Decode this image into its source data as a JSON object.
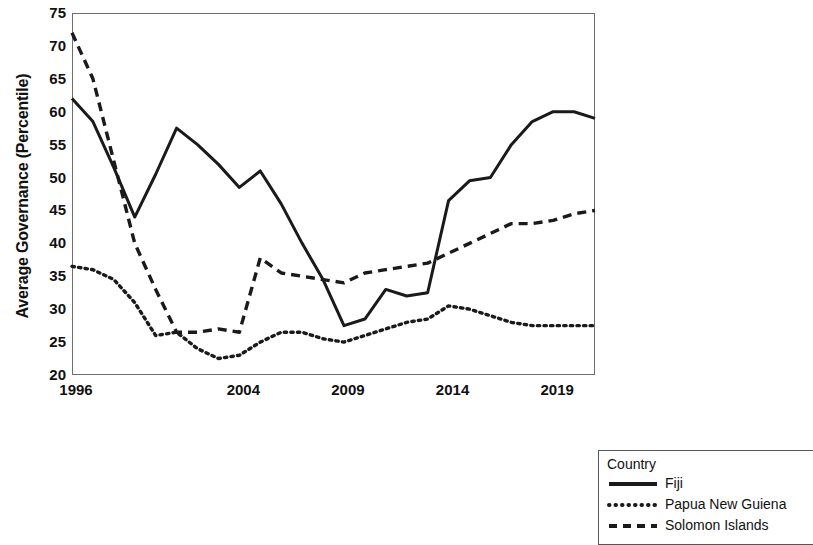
{
  "chart_data": {
    "type": "line",
    "title": "",
    "xlabel": "",
    "ylabel": "Average Governance (Percentile)",
    "xlim": [
      1996,
      2021
    ],
    "ylim": [
      20,
      75
    ],
    "ytick_labels": [
      "75",
      "70",
      "65",
      "60",
      "55",
      "50",
      "45",
      "40",
      "35",
      "30",
      "25",
      "20"
    ],
    "ytick_values": [
      75,
      70,
      65,
      60,
      55,
      50,
      45,
      40,
      35,
      30,
      25,
      20
    ],
    "xtick_labels": [
      "1996",
      "2004",
      "2009",
      "2014",
      "2019"
    ],
    "xtick_values": [
      1996,
      2004,
      2009,
      2014,
      2019
    ],
    "grid": false,
    "legend_position": "bottom-right",
    "legend_title": "Country",
    "x": [
      1996,
      1997,
      1998,
      1999,
      2000,
      2001,
      2002,
      2003,
      2004,
      2005,
      2006,
      2007,
      2008,
      2009,
      2010,
      2011,
      2012,
      2013,
      2014,
      2015,
      2016,
      2017,
      2018,
      2019,
      2020,
      2021
    ],
    "series": [
      {
        "name": "Fiji",
        "style": "solid",
        "color": "#1a1a1a",
        "values": [
          62.0,
          58.5,
          51.5,
          44.0,
          50.5,
          57.5,
          55.0,
          52.0,
          48.5,
          51.0,
          46.0,
          40.0,
          34.5,
          27.5,
          28.5,
          33.0,
          32.0,
          32.5,
          46.5,
          49.5,
          50.0,
          55.0,
          58.5,
          60.0,
          60.0,
          59.0
        ]
      },
      {
        "name": "Papua New Guiena",
        "style": "dotted",
        "color": "#1a1a1a",
        "values": [
          36.5,
          36.0,
          34.5,
          31.0,
          26.0,
          26.5,
          24.0,
          22.5,
          23.0,
          25.0,
          26.5,
          26.5,
          25.5,
          25.0,
          26.0,
          27.0,
          28.0,
          28.5,
          30.5,
          30.0,
          29.0,
          28.0,
          27.5,
          27.5,
          27.5,
          27.5
        ]
      },
      {
        "name": "Solomon Islands",
        "style": "dashed",
        "color": "#1a1a1a",
        "values": [
          72.0,
          65.0,
          52.5,
          40.0,
          33.0,
          26.5,
          26.5,
          27.0,
          26.5,
          37.8,
          35.5,
          35.0,
          34.5,
          34.0,
          35.5,
          36.0,
          36.5,
          37.0,
          38.5,
          40.0,
          41.5,
          43.0,
          43.0,
          43.5,
          44.5,
          45.0
        ]
      }
    ]
  },
  "axes": {
    "y_title": "Average Governance (Percentile)"
  },
  "legend": {
    "title": "Country",
    "entries": [
      {
        "label": "Fiji",
        "style": "solid"
      },
      {
        "label": "Papua New Guiena",
        "style": "dotted"
      },
      {
        "label": "Solomon Islands",
        "style": "dashed"
      }
    ]
  }
}
